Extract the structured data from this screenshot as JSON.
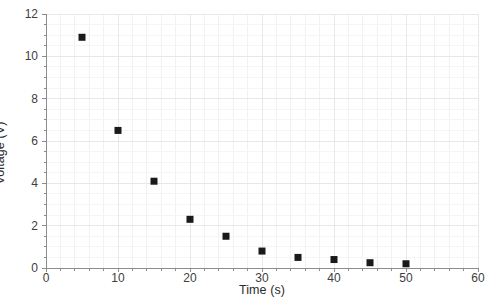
{
  "chart_data": {
    "type": "scatter",
    "title": "",
    "xlabel": "Time (s)",
    "ylabel": "Voltage (V)",
    "xlim": [
      0,
      60
    ],
    "ylim": [
      0,
      12
    ],
    "xticks": [
      0,
      10,
      20,
      30,
      40,
      50,
      60
    ],
    "yticks": [
      0,
      2,
      4,
      6,
      8,
      10,
      12
    ],
    "xtick_labels": [
      "0",
      "10",
      "20",
      "30",
      "40",
      "50",
      "60"
    ],
    "ytick_labels": [
      "0",
      "2",
      "4",
      "6",
      "8",
      "10",
      "12"
    ],
    "x_minor_tick_step": 2,
    "y_minor_tick_step": 0.5,
    "grid": true,
    "grid_color": "#e8e8e8",
    "axis_color": "#8c8c8c",
    "legend": false,
    "marker": "square",
    "marker_color": "#1a1a1a",
    "marker_size": 7,
    "series": [
      {
        "name": "Voltage",
        "x": [
          5,
          10,
          15,
          20,
          25,
          30,
          35,
          40,
          45,
          50
        ],
        "y": [
          10.9,
          6.5,
          4.1,
          2.3,
          1.5,
          0.8,
          0.5,
          0.4,
          0.25,
          0.2
        ]
      }
    ]
  }
}
